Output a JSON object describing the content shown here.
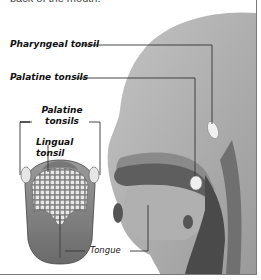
{
  "caption": "back of the mouth.",
  "labels": {
    "pharyngeal": "Pharyngeal tonsil",
    "palatine_head": "Palatine tonsils",
    "palatine_tongue_line1": "Palatine",
    "palatine_tongue_line2": "tonsils",
    "lingual_line1": "Lingual",
    "lingual_line2": "tonsil",
    "tongue": "Tongue"
  },
  "colors": {
    "head_fill": "#a8a8a8",
    "head_dark": "#6e6e6e",
    "throat_dark": "#4a4a4a",
    "tonsil_fill": "#eeeeee",
    "leader_line": "#333333",
    "border": "#7a7a7a"
  }
}
